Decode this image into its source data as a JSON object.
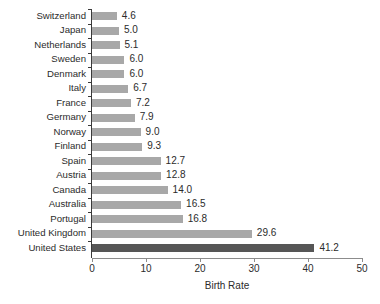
{
  "chart_data": {
    "type": "bar",
    "orientation": "horizontal",
    "title": "",
    "xlabel": "Birth Rate",
    "ylabel": "",
    "xlim": [
      0,
      50
    ],
    "xticks": [
      0,
      10,
      20,
      30,
      40,
      50
    ],
    "grid": false,
    "legend": null,
    "categories": [
      "Switzerland",
      "Japan",
      "Netherlands",
      "Sweden",
      "Denmark",
      "Italy",
      "France",
      "Germany",
      "Norway",
      "Finland",
      "Spain",
      "Austria",
      "Canada",
      "Australia",
      "Portugal",
      "United Kingdom",
      "United States"
    ],
    "values": [
      4.6,
      5.0,
      5.1,
      6.0,
      6.0,
      6.7,
      7.2,
      7.9,
      9.0,
      9.3,
      12.7,
      12.8,
      14.0,
      16.5,
      16.8,
      29.6,
      41.2
    ],
    "value_labels": [
      "4.6",
      "5.0",
      "5.1",
      "6.0",
      "6.0",
      "6.7",
      "7.2",
      "7.9",
      "9.0",
      "9.3",
      "12.7",
      "12.8",
      "14.0",
      "16.5",
      "16.8",
      "29.6",
      "41.2"
    ],
    "highlight_category": "United States",
    "colors": {
      "bar": "#a8a8a8",
      "bar_highlight": "#565656",
      "axis": "#8c8c8c",
      "text": "#2b2b2b",
      "background": "#ffffff"
    }
  }
}
